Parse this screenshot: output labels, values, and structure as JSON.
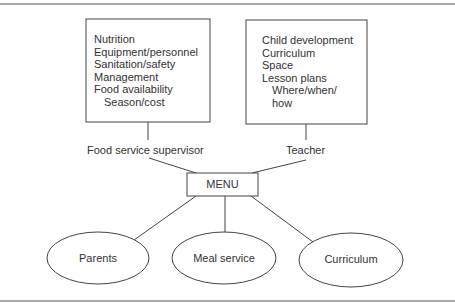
{
  "diagram": {
    "supervisor_box": {
      "items": [
        "Nutrition",
        "Equipment/personnel",
        "Sanitation/safety",
        "Management",
        "Food availability"
      ],
      "sub_items": [
        "Season/cost"
      ]
    },
    "teacher_box": {
      "items": [
        "Child development",
        "Curriculum",
        "Space",
        "Lesson plans"
      ],
      "sub_items": [
        "Where/when/",
        "how"
      ]
    },
    "roles": {
      "supervisor": "Food service supervisor",
      "teacher": "Teacher"
    },
    "center_node": "MENU",
    "outcomes": [
      "Parents",
      "Meal service",
      "Curriculum"
    ],
    "colors": {
      "line": "#444444",
      "text": "#333333",
      "background": "#ffffff"
    }
  }
}
